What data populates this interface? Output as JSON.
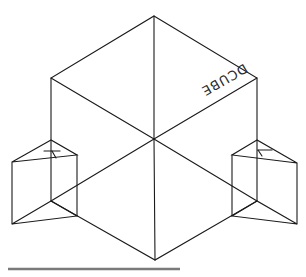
{
  "diagram": {
    "title": "",
    "cube": {
      "label": "DCUBE",
      "label_orientation": "rotated, upside-down along top-right face edge",
      "vertices": {
        "top": [
          154,
          16
        ],
        "upper_left": [
          51,
          78
        ],
        "upper_right": [
          257,
          78
        ],
        "center": [
          154,
          139
        ],
        "lower_left": [
          51,
          201
        ],
        "lower_right": [
          257,
          201
        ],
        "bottom": [
          155,
          260
        ]
      }
    },
    "left_prism": {
      "axis_label": "Y",
      "top_apex": [
        51,
        140
      ],
      "top_left": [
        12,
        162
      ],
      "top_right": [
        77,
        155
      ],
      "bottom_apex": [
        51,
        201
      ],
      "bottom_left": [
        12,
        224
      ],
      "bottom_right": [
        77,
        216
      ]
    },
    "right_prism": {
      "axis_label": "Y",
      "top_apex": [
        257,
        140
      ],
      "top_left": [
        232,
        155
      ],
      "top_right": [
        297,
        163
      ],
      "bottom_apex": [
        257,
        201
      ],
      "bottom_left": [
        232,
        216
      ],
      "bottom_right": [
        297,
        224
      ]
    },
    "baseline_bar": {
      "x1": 8,
      "x2": 180,
      "y": 269,
      "color": "#7a7a7a"
    },
    "line_color": "#1a1a1a"
  }
}
